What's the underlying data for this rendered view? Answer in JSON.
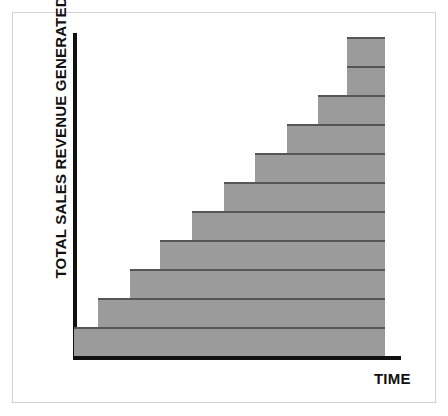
{
  "chart_data": {
    "type": "bar",
    "orientation": "horizontal-staircase",
    "title": "",
    "subtitle": "",
    "xlabel": "TIME",
    "ylabel": "TOTAL SALES REVENUE GENERATED",
    "grid": false,
    "legend": null,
    "axis_tick_labels": {
      "x": [],
      "y": []
    },
    "xlim": [
      0,
      11
    ],
    "ylim": [
      0,
      11
    ],
    "categories": [
      "1",
      "2",
      "3",
      "4",
      "5",
      "6",
      "7",
      "8",
      "9",
      "10",
      "11"
    ],
    "values": [
      1,
      2,
      3,
      4,
      5,
      6,
      7,
      8,
      9,
      10,
      11
    ],
    "bars": [
      {
        "index": 1,
        "level": 1,
        "start": 0,
        "end": 11,
        "left_px": 74,
        "right_px": 385,
        "top_px": 327,
        "height_px": 29
      },
      {
        "index": 2,
        "level": 2,
        "start": 1,
        "end": 11,
        "left_px": 98,
        "right_px": 385,
        "top_px": 298,
        "height_px": 29
      },
      {
        "index": 3,
        "level": 3,
        "start": 2,
        "end": 11,
        "left_px": 130,
        "right_px": 385,
        "top_px": 269,
        "height_px": 29
      },
      {
        "index": 4,
        "level": 4,
        "start": 3,
        "end": 11,
        "left_px": 160,
        "right_px": 385,
        "top_px": 240,
        "height_px": 29
      },
      {
        "index": 5,
        "level": 5,
        "start": 4,
        "end": 11,
        "left_px": 192,
        "right_px": 385,
        "top_px": 211,
        "height_px": 29
      },
      {
        "index": 6,
        "level": 6,
        "start": 5,
        "end": 11,
        "left_px": 224,
        "right_px": 385,
        "top_px": 182,
        "height_px": 29
      },
      {
        "index": 7,
        "level": 7,
        "start": 6,
        "end": 11,
        "left_px": 255,
        "right_px": 385,
        "top_px": 153,
        "height_px": 29
      },
      {
        "index": 8,
        "level": 8,
        "start": 7,
        "end": 11,
        "left_px": 287,
        "right_px": 385,
        "top_px": 124,
        "height_px": 29
      },
      {
        "index": 9,
        "level": 9,
        "start": 8,
        "end": 11,
        "left_px": 318,
        "right_px": 385,
        "top_px": 95,
        "height_px": 29
      },
      {
        "index": 10,
        "level": 10,
        "start": 9,
        "end": 11,
        "left_px": 347,
        "right_px": 385,
        "top_px": 66,
        "height_px": 29
      },
      {
        "index": 11,
        "level": 11,
        "start": 9,
        "end": 11,
        "left_px": 347,
        "right_px": 385,
        "top_px": 37,
        "height_px": 29
      }
    ],
    "colors": {
      "bar_fill": "#9b9b9b",
      "bar_edge": "#56565a",
      "axis": "#111111",
      "background": "#ffffff",
      "frame": "#d2d2d2",
      "text": "#111111"
    }
  }
}
